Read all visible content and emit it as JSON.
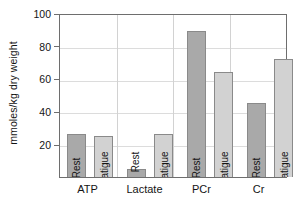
{
  "chart_data": {
    "type": "bar",
    "title": "",
    "xlabel": "",
    "ylabel": "mmoles/kg dry weight",
    "ylim": [
      0,
      100
    ],
    "yticks": [
      20,
      40,
      60,
      80,
      100
    ],
    "ytick_labels": [
      "20",
      "40",
      "60",
      "80",
      "100"
    ],
    "categories": [
      "ATP",
      "Lactate",
      "PCr",
      "Cr"
    ],
    "grid": {
      "horizontal": true,
      "vertical": true
    },
    "legend": {
      "position": "in-bar-labels"
    },
    "series": [
      {
        "name": "Rest",
        "color": "#a9a9a9",
        "values": [
          26,
          5,
          89,
          45
        ]
      },
      {
        "name": "Fatigue",
        "color": "#d2d2d2",
        "values": [
          25,
          26,
          64,
          72
        ]
      }
    ],
    "bar_labels": [
      [
        "Rest",
        "Fatigue"
      ],
      [
        "Rest",
        "Fatigue"
      ],
      [
        "Rest",
        "Fatigue"
      ],
      [
        "Rest",
        "Fatigue"
      ]
    ]
  }
}
